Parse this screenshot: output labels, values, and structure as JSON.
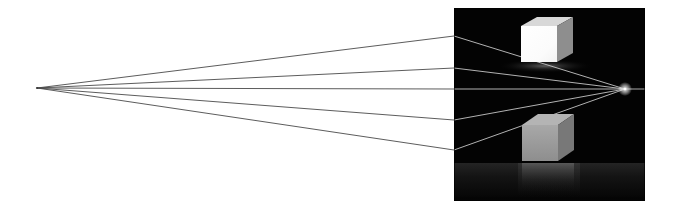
{
  "figure": {
    "canvas": {
      "width": 674,
      "height": 213,
      "background": "#ffffff"
    },
    "left_vanishing_point": {
      "x": 37,
      "y": 88,
      "label": "left vanishing point"
    },
    "right_vanishing_point": {
      "x": 625,
      "y": 89,
      "label": "right vanishing point"
    },
    "projection_lines": {
      "count": 5,
      "color_on_white": "#4a4a4a",
      "color_on_black": "#c8c8c8",
      "width": 1,
      "endpoints_at_panel_left_edge": [
        {
          "id": "ray-1",
          "x": 454,
          "y": 36
        },
        {
          "id": "ray-2",
          "x": 454,
          "y": 68
        },
        {
          "id": "ray-3",
          "x": 454,
          "y": 89
        },
        {
          "id": "ray-4",
          "x": 454,
          "y": 120
        },
        {
          "id": "ray-5",
          "x": 454,
          "y": 150
        }
      ],
      "horizon_ray_extends_to_x": 645
    },
    "render_panel": {
      "label": "rendered 3D scene",
      "x": 454,
      "y": 8,
      "width": 191,
      "height": 193,
      "background": "#030303",
      "border_color": "#000000"
    },
    "objects": [
      {
        "id": "upper-cube",
        "label": "white cube above horizon",
        "front_face": {
          "x": 521,
          "y": 26,
          "width": 36,
          "height": 36,
          "color": "#fdfdfd"
        },
        "right_face_color": "#8e8e8e",
        "top_face_color": "#d8d8d8",
        "shadow_color": "#3a3a3a"
      },
      {
        "id": "lower-cube",
        "label": "gray cube below horizon on reflective floor",
        "front_face": {
          "x": 522,
          "y": 125,
          "width": 36,
          "height": 36,
          "color": "#9b9b9b"
        },
        "top_face_color": "#b4b4b4",
        "right_face_color": "#787878",
        "reflection_color": "#2a2a2a"
      }
    ],
    "floor": {
      "label": "reflective floor plane",
      "top_y": 163,
      "bottom_y": 201,
      "color_near": "#1a1a1a",
      "color_far": "#050505"
    },
    "colors": {
      "white_background": "#ffffff",
      "panel_black": "#030303",
      "line_dark": "#4a4a4a",
      "line_light": "#c8c8c8",
      "cube_white": "#fdfdfd",
      "cube_gray": "#9b9b9b"
    }
  }
}
